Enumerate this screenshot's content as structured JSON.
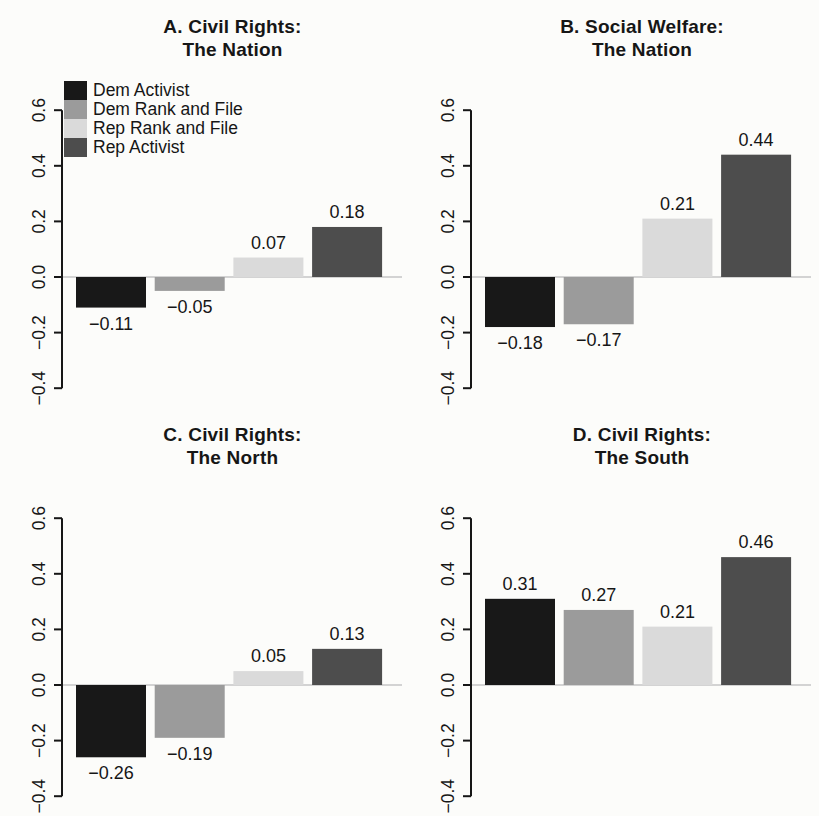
{
  "figure": {
    "background": "#fcfcfa",
    "axis_color": "#161616",
    "zero_line_color": "#c6c6c6",
    "layout": "2x2-grid"
  },
  "legend": {
    "position": "top-left-of-panel-A",
    "items": [
      {
        "label": "Dem Activist",
        "color": "#181818"
      },
      {
        "label": "Dem Rank and File",
        "color": "#9b9b9b"
      },
      {
        "label": "Rep Rank and File",
        "color": "#dadada"
      },
      {
        "label": "Rep Activist",
        "color": "#4d4d4d"
      }
    ]
  },
  "chart_data": [
    {
      "type": "bar",
      "panel": "A",
      "title_line1": "A. Civil Rights:",
      "title_line2": "The Nation",
      "categories": [
        "Dem Activist",
        "Dem Rank and File",
        "Rep Rank and File",
        "Rep Activist"
      ],
      "values": [
        -0.11,
        -0.05,
        0.07,
        0.18
      ],
      "value_labels": [
        "−0.11",
        "−0.05",
        "0.07",
        "0.18"
      ],
      "ylim": [
        -0.4,
        0.6
      ],
      "yticks": [
        -0.4,
        -0.2,
        0,
        0.2,
        0.4,
        0.6
      ],
      "ytick_labels": [
        "−0.4",
        "−0.2",
        "0.0",
        "0.2",
        "0.4",
        "0.6"
      ],
      "grid": false,
      "legend_visible": true
    },
    {
      "type": "bar",
      "panel": "B",
      "title_line1": "B. Social Welfare:",
      "title_line2": "The Nation",
      "categories": [
        "Dem Activist",
        "Dem Rank and File",
        "Rep Rank and File",
        "Rep Activist"
      ],
      "values": [
        -0.18,
        -0.17,
        0.21,
        0.44
      ],
      "value_labels": [
        "−0.18",
        "−0.17",
        "0.21",
        "0.44"
      ],
      "ylim": [
        -0.4,
        0.6
      ],
      "yticks": [
        -0.4,
        -0.2,
        0,
        0.2,
        0.4,
        0.6
      ],
      "ytick_labels": [
        "−0.4",
        "−0.2",
        "0.0",
        "0.2",
        "0.4",
        "0.6"
      ],
      "grid": false,
      "legend_visible": false
    },
    {
      "type": "bar",
      "panel": "C",
      "title_line1": "C. Civil Rights:",
      "title_line2": "The North",
      "categories": [
        "Dem Activist",
        "Dem Rank and File",
        "Rep Rank and File",
        "Rep Activist"
      ],
      "values": [
        -0.26,
        -0.19,
        0.05,
        0.13
      ],
      "value_labels": [
        "−0.26",
        "−0.19",
        "0.05",
        "0.13"
      ],
      "ylim": [
        -0.4,
        0.6
      ],
      "yticks": [
        -0.4,
        -0.2,
        0,
        0.2,
        0.4,
        0.6
      ],
      "ytick_labels": [
        "−0.4",
        "−0.2",
        "0.0",
        "0.2",
        "0.4",
        "0.6"
      ],
      "grid": false,
      "legend_visible": false
    },
    {
      "type": "bar",
      "panel": "D",
      "title_line1": "D. Civil Rights:",
      "title_line2": "The South",
      "categories": [
        "Dem Activist",
        "Dem Rank and File",
        "Rep Rank and File",
        "Rep Activist"
      ],
      "values": [
        0.31,
        0.27,
        0.21,
        0.46
      ],
      "value_labels": [
        "0.31",
        "0.27",
        "0.21",
        "0.46"
      ],
      "ylim": [
        -0.4,
        0.6
      ],
      "yticks": [
        -0.4,
        -0.2,
        0,
        0.2,
        0.4,
        0.6
      ],
      "ytick_labels": [
        "−0.4",
        "−0.2",
        "0.0",
        "0.2",
        "0.4",
        "0.6"
      ],
      "grid": false,
      "legend_visible": false
    }
  ]
}
